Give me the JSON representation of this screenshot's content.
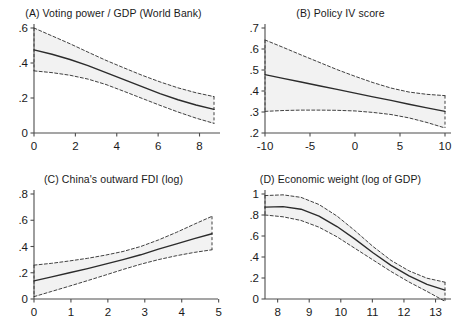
{
  "figure": {
    "background": "#ffffff",
    "line_color": "#2b2b2b",
    "band_fill": "#f2f2f2",
    "axis_color": "#4d4d4d"
  },
  "panels": [
    {
      "id": "A",
      "title": "(A) Voting power / GDP (World Bank)"
    },
    {
      "id": "B",
      "title": "(B) Policy IV score"
    },
    {
      "id": "C",
      "title": "(C) China's outward FDI (log)"
    },
    {
      "id": "D",
      "title": "(D) Economic weight (log of GDP)"
    }
  ],
  "chart_data": [
    {
      "type": "line",
      "panel": "A",
      "title": "(A) Voting power / GDP (World Bank)",
      "xlabel": "",
      "ylabel": "",
      "xlim": [
        0,
        8.7
      ],
      "ylim": [
        0,
        0.6
      ],
      "xticks": [
        0,
        2,
        4,
        6,
        8
      ],
      "xticklabels": [
        "0",
        "2",
        "4",
        "6",
        "8"
      ],
      "yticks": [
        0,
        0.2,
        0.4,
        0.6
      ],
      "yticklabels": [
        "0",
        ".2",
        ".4",
        ".6"
      ],
      "grid": false,
      "legend": "none",
      "x": [
        0,
        0.87,
        1.74,
        2.61,
        3.48,
        4.35,
        5.22,
        6.09,
        6.96,
        7.83,
        8.7
      ],
      "series": [
        {
          "name": "Marginal effect",
          "style": "solid",
          "values": [
            0.475,
            0.45,
            0.42,
            0.385,
            0.345,
            0.305,
            0.265,
            0.225,
            0.19,
            0.16,
            0.135
          ]
        },
        {
          "name": "Upper 95% CI",
          "style": "dashed",
          "values": [
            0.6,
            0.555,
            0.51,
            0.462,
            0.415,
            0.372,
            0.33,
            0.292,
            0.258,
            0.23,
            0.208
          ]
        },
        {
          "name": "Lower 95% CI",
          "style": "dashed",
          "values": [
            0.355,
            0.345,
            0.33,
            0.308,
            0.277,
            0.238,
            0.198,
            0.158,
            0.12,
            0.085,
            0.055
          ]
        }
      ]
    },
    {
      "type": "line",
      "panel": "B",
      "title": "(B) Policy IV score",
      "xlabel": "",
      "ylabel": "",
      "xlim": [
        -10,
        10
      ],
      "ylim": [
        0.2,
        0.7
      ],
      "xticks": [
        -10,
        -5,
        0,
        5,
        10
      ],
      "xticklabels": [
        "-10",
        "-5",
        "0",
        "5",
        "10"
      ],
      "yticks": [
        0.2,
        0.3,
        0.4,
        0.5,
        0.6,
        0.7
      ],
      "yticklabels": [
        ".2",
        ".3",
        ".4",
        ".5",
        ".6",
        ".7"
      ],
      "grid": false,
      "legend": "none",
      "x": [
        -10,
        -8,
        -6,
        -4,
        -2,
        0,
        2,
        4,
        6,
        8,
        10
      ],
      "series": [
        {
          "name": "Marginal effect",
          "style": "solid",
          "values": [
            0.478,
            0.46,
            0.443,
            0.425,
            0.408,
            0.39,
            0.372,
            0.355,
            0.337,
            0.32,
            0.303
          ]
        },
        {
          "name": "Upper 95% CI",
          "style": "dashed",
          "values": [
            0.643,
            0.608,
            0.572,
            0.537,
            0.502,
            0.47,
            0.44,
            0.414,
            0.395,
            0.384,
            0.378
          ]
        },
        {
          "name": "Lower 95% CI",
          "style": "dashed",
          "values": [
            0.303,
            0.307,
            0.309,
            0.309,
            0.308,
            0.305,
            0.298,
            0.288,
            0.272,
            0.25,
            0.224
          ]
        }
      ]
    },
    {
      "type": "line",
      "panel": "C",
      "title": "(C) China's outward FDI (log)",
      "xlabel": "",
      "ylabel": "",
      "xlim": [
        0,
        4.82
      ],
      "ylim": [
        0,
        0.8
      ],
      "xticks": [
        0,
        1,
        2,
        3,
        4,
        5
      ],
      "xticklabels": [
        "0",
        "1",
        "2",
        "3",
        "4",
        "5"
      ],
      "yticks": [
        0,
        0.2,
        0.4,
        0.6,
        0.8
      ],
      "yticklabels": [
        "0",
        ".2",
        ".4",
        ".6",
        ".8"
      ],
      "grid": false,
      "legend": "none",
      "x": [
        0,
        0.48,
        0.96,
        1.45,
        1.93,
        2.41,
        2.89,
        3.37,
        3.86,
        4.34,
        4.82
      ],
      "series": [
        {
          "name": "Marginal effect",
          "style": "solid",
          "values": [
            0.138,
            0.168,
            0.2,
            0.232,
            0.265,
            0.3,
            0.337,
            0.38,
            0.42,
            0.46,
            0.497
          ]
        },
        {
          "name": "Upper 95% CI",
          "style": "dashed",
          "values": [
            0.258,
            0.272,
            0.29,
            0.31,
            0.334,
            0.362,
            0.4,
            0.45,
            0.508,
            0.57,
            0.63
          ]
        },
        {
          "name": "Lower 95% CI",
          "style": "dashed",
          "values": [
            0.018,
            0.058,
            0.098,
            0.14,
            0.182,
            0.225,
            0.265,
            0.3,
            0.33,
            0.355,
            0.375
          ]
        }
      ]
    },
    {
      "type": "line",
      "panel": "D",
      "title": "(D) Economic weight (log of GDP)",
      "xlabel": "",
      "ylabel": "",
      "xlim": [
        7.6,
        13.3
      ],
      "ylim": [
        0,
        1.0
      ],
      "xticks": [
        8,
        9,
        10,
        11,
        12,
        13
      ],
      "xticklabels": [
        "8",
        "9",
        "10",
        "11",
        "12",
        "13"
      ],
      "yticks": [
        0,
        0.2,
        0.4,
        0.6,
        0.8,
        1.0
      ],
      "yticklabels": [
        "0",
        ".2",
        ".4",
        ".6",
        ".8",
        "1"
      ],
      "grid": false,
      "legend": "none",
      "x": [
        7.6,
        8.17,
        8.74,
        9.31,
        9.88,
        10.45,
        11.02,
        11.59,
        12.16,
        12.73,
        13.3
      ],
      "series": [
        {
          "name": "Marginal effect",
          "style": "solid",
          "values": [
            0.875,
            0.88,
            0.855,
            0.79,
            0.69,
            0.57,
            0.44,
            0.32,
            0.22,
            0.14,
            0.085
          ]
        },
        {
          "name": "Upper 95% CI",
          "style": "dashed",
          "values": [
            0.985,
            0.992,
            0.968,
            0.9,
            0.79,
            0.65,
            0.5,
            0.368,
            0.268,
            0.198,
            0.16
          ]
        },
        {
          "name": "Lower 95% CI",
          "style": "dashed",
          "values": [
            0.8,
            0.783,
            0.748,
            0.684,
            0.592,
            0.482,
            0.372,
            0.262,
            0.162,
            0.072,
            -0.022
          ]
        }
      ]
    }
  ]
}
